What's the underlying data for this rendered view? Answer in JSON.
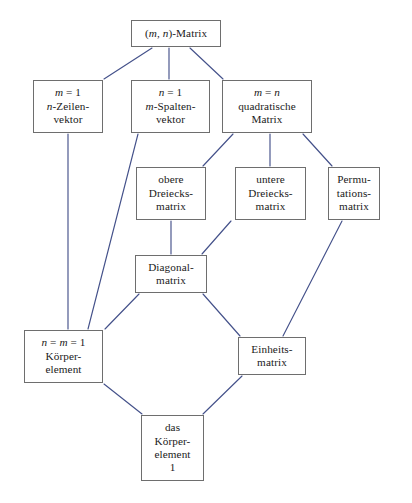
{
  "diagram": {
    "canvas": {
      "width": 412,
      "height": 503
    },
    "colors": {
      "background": "#ffffff",
      "box_border": "#6e6e6e",
      "edge_line": "#44518a",
      "text": "#1a1a1a"
    },
    "nodes": [
      {
        "id": "mn-matrix",
        "name": "mn-matrix-node",
        "lines": [
          "(m, n)-Matrix"
        ],
        "x": 131,
        "y": 20,
        "w": 90,
        "h": 27
      },
      {
        "id": "zeilenvektor",
        "name": "zeilenvektor-node",
        "lines": [
          "m = 1",
          "n-Zeilen-",
          "vektor"
        ],
        "x": 33,
        "y": 80,
        "w": 70,
        "h": 53
      },
      {
        "id": "spaltenvektor",
        "name": "spaltenvektor-node",
        "lines": [
          "n = 1",
          "m-Spalten-",
          "vektor"
        ],
        "x": 131,
        "y": 80,
        "w": 79,
        "h": 53
      },
      {
        "id": "quadratische-matrix",
        "name": "quadratische-matrix-node",
        "lines": [
          "m = n",
          "quadratische",
          "Matrix"
        ],
        "x": 222,
        "y": 80,
        "w": 90,
        "h": 53
      },
      {
        "id": "obere-dreiecksmatrix",
        "name": "obere-dreiecksmatrix-node",
        "lines": [
          "obere",
          "Dreiecks-",
          "matrix"
        ],
        "x": 136,
        "y": 167,
        "w": 70,
        "h": 53
      },
      {
        "id": "untere-dreiecksmatrix",
        "name": "untere-dreiecksmatrix-node",
        "lines": [
          "untere",
          "Dreiecks-",
          "matrix"
        ],
        "x": 235,
        "y": 167,
        "w": 71,
        "h": 53
      },
      {
        "id": "permutationsmatrix",
        "name": "permutationsmatrix-node",
        "lines": [
          "Permu-",
          "tations-",
          "matrix"
        ],
        "x": 328,
        "y": 167,
        "w": 52,
        "h": 53
      },
      {
        "id": "diagonalmatrix",
        "name": "diagonalmatrix-node",
        "lines": [
          "Diagonal-",
          "matrix"
        ],
        "x": 135,
        "y": 255,
        "w": 72,
        "h": 38
      },
      {
        "id": "koerperelement",
        "name": "koerperelement-node",
        "lines": [
          "n =  m = 1",
          "Körper-",
          "element"
        ],
        "x": 24,
        "y": 330,
        "w": 79,
        "h": 53
      },
      {
        "id": "einheitsmatrix",
        "name": "einheitsmatrix-node",
        "lines": [
          "Einheits-",
          "matrix"
        ],
        "x": 238,
        "y": 337,
        "w": 68,
        "h": 38
      },
      {
        "id": "das-koerperelement-1",
        "name": "das-koerperelement-1-node",
        "lines": [
          "das",
          "Körper-",
          "element",
          "1"
        ],
        "x": 141,
        "y": 415,
        "w": 63,
        "h": 66
      }
    ],
    "edges": [
      {
        "name": "edge-mnmatrix-to-zeilenvektor",
        "from": "mn-matrix",
        "to": "zeilenvektor",
        "x1": 152,
        "y1": 48,
        "x2": 104,
        "y2": 79
      },
      {
        "name": "edge-mnmatrix-to-spaltenvektor",
        "from": "mn-matrix",
        "to": "spaltenvektor",
        "x1": 169,
        "y1": 48,
        "x2": 169,
        "y2": 79
      },
      {
        "name": "edge-mnmatrix-to-quadratische",
        "from": "mn-matrix",
        "to": "quadratische-matrix",
        "x1": 190,
        "y1": 48,
        "x2": 223,
        "y2": 79
      },
      {
        "name": "edge-zeilenvektor-to-koerperelement",
        "from": "zeilenvektor",
        "to": "koerperelement",
        "x1": 68,
        "y1": 134,
        "x2": 68,
        "y2": 329
      },
      {
        "name": "edge-spaltenvektor-to-koerperelement",
        "from": "spaltenvektor",
        "to": "koerperelement",
        "x1": 138,
        "y1": 134,
        "x2": 88,
        "y2": 329
      },
      {
        "name": "edge-quadratische-to-obere",
        "from": "quadratische-matrix",
        "to": "obere-dreiecksmatrix",
        "x1": 233,
        "y1": 134,
        "x2": 203,
        "y2": 166
      },
      {
        "name": "edge-quadratische-to-untere",
        "from": "quadratische-matrix",
        "to": "untere-dreiecksmatrix",
        "x1": 270,
        "y1": 134,
        "x2": 270,
        "y2": 166
      },
      {
        "name": "edge-quadratische-to-permutations",
        "from": "quadratische-matrix",
        "to": "permutationsmatrix",
        "x1": 303,
        "y1": 134,
        "x2": 332,
        "y2": 166
      },
      {
        "name": "edge-obere-to-diagonal",
        "from": "obere-dreiecksmatrix",
        "to": "diagonalmatrix",
        "x1": 171,
        "y1": 221,
        "x2": 171,
        "y2": 254
      },
      {
        "name": "edge-untere-to-diagonal",
        "from": "untere-dreiecksmatrix",
        "to": "diagonalmatrix",
        "x1": 231,
        "y1": 221,
        "x2": 202,
        "y2": 254
      },
      {
        "name": "edge-permutations-to-einheits",
        "from": "permutationsmatrix",
        "to": "einheitsmatrix",
        "x1": 342,
        "y1": 221,
        "x2": 283,
        "y2": 336
      },
      {
        "name": "edge-diagonal-to-koerperelement",
        "from": "diagonalmatrix",
        "to": "koerperelement",
        "x1": 139,
        "y1": 294,
        "x2": 105,
        "y2": 329
      },
      {
        "name": "edge-diagonal-to-einheits",
        "from": "diagonalmatrix",
        "to": "einheitsmatrix",
        "x1": 203,
        "y1": 294,
        "x2": 240,
        "y2": 336
      },
      {
        "name": "edge-koerperelement-to-das",
        "from": "koerperelement",
        "to": "das-koerperelement-1",
        "x1": 104,
        "y1": 384,
        "x2": 142,
        "y2": 414
      },
      {
        "name": "edge-einheits-to-das",
        "from": "einheitsmatrix",
        "to": "das-koerperelement-1",
        "x1": 242,
        "y1": 376,
        "x2": 203,
        "y2": 414
      }
    ]
  }
}
